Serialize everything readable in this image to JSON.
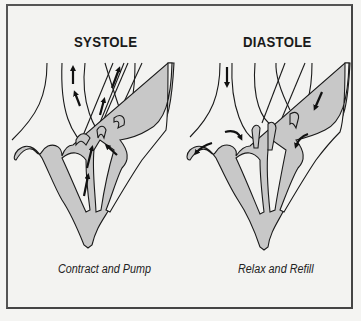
{
  "diagram": {
    "panels": [
      {
        "id": "systole",
        "title": "SYSTOLE",
        "caption": "Contract and Pump",
        "arrows": "blood flowing upward out of ventricles through aorta and pulmonary artery"
      },
      {
        "id": "diastole",
        "title": "DIASTOLE",
        "caption": "Relax and Refill",
        "arrows": "blood flowing downward into atria and ventricles"
      }
    ],
    "colors": {
      "background": "#f3f3f1",
      "frame": "#555555",
      "heart_fill": "#c8c8c8",
      "outline": "#1a1a1a"
    }
  }
}
